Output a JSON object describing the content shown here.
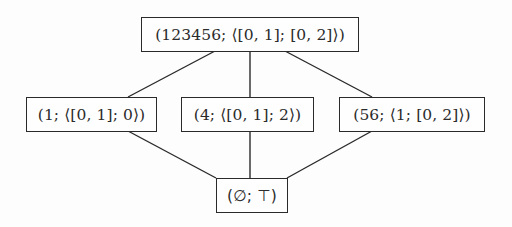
{
  "diagram": {
    "type": "lattice",
    "nodes": [
      {
        "id": "top",
        "label": "(123456; ⟨[0, 1]; [0, 2]⟩)"
      },
      {
        "id": "left",
        "label": "(1; ⟨[0, 1]; 0⟩)"
      },
      {
        "id": "middle",
        "label": "(4; ⟨[0, 1]; 2⟩)"
      },
      {
        "id": "right",
        "label": "(56; ⟨1; [0, 2]⟩)"
      },
      {
        "id": "bottom",
        "label": "(∅; ⊤)"
      }
    ],
    "edges": [
      {
        "from": "top",
        "to": "left"
      },
      {
        "from": "top",
        "to": "middle"
      },
      {
        "from": "top",
        "to": "right"
      },
      {
        "from": "left",
        "to": "bottom"
      },
      {
        "from": "middle",
        "to": "bottom"
      },
      {
        "from": "right",
        "to": "bottom"
      }
    ]
  }
}
